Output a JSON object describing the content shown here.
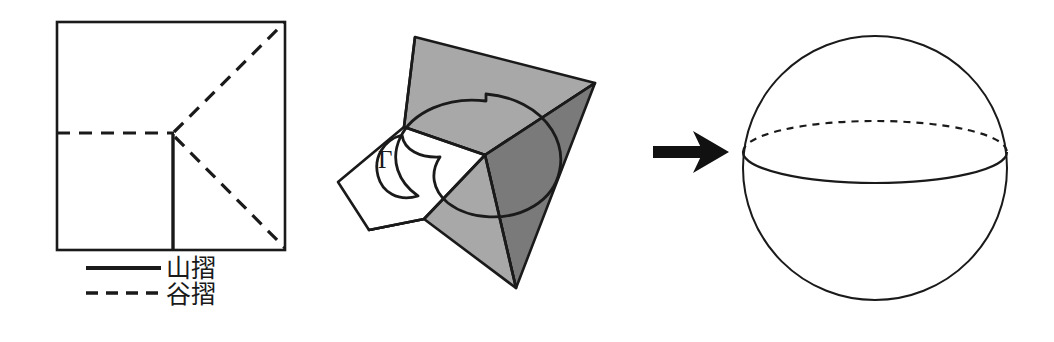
{
  "figure": {
    "colors": {
      "ink": "#1a1a1a",
      "paper_white": "#ffffff",
      "panel_light_gray": "#a8a8a8",
      "panel_dark_gray": "#7a7a7a",
      "arrow": "#111111"
    },
    "panels": [
      {
        "name": "crease-pattern",
        "index": 1
      },
      {
        "name": "folded-form",
        "index": 2
      },
      {
        "name": "sphere",
        "index": 3
      }
    ]
  },
  "crease_pattern": {
    "square": {
      "x": 57,
      "y": 22,
      "size": 228
    },
    "center_vertex": {
      "x": 173,
      "y": 134
    },
    "creases": [
      {
        "name": "mountain-vertical",
        "type": "mountain",
        "from": [
          173,
          134
        ],
        "to": [
          173,
          250
        ]
      },
      {
        "name": "valley-horizontal",
        "type": "valley",
        "from": [
          57,
          133
        ],
        "to": [
          173,
          133
        ]
      },
      {
        "name": "valley-diagonal-up",
        "type": "valley",
        "from": [
          173,
          133
        ],
        "to": [
          285,
          22
        ]
      },
      {
        "name": "valley-diagonal-down",
        "type": "valley",
        "from": [
          173,
          136
        ],
        "to": [
          285,
          248
        ]
      }
    ]
  },
  "legend": {
    "items": [
      {
        "name": "mountain-fold",
        "style": "solid",
        "label": "山摺"
      },
      {
        "name": "valley-fold",
        "style": "dashed",
        "label": "谷摺"
      }
    ]
  },
  "folded_form": {
    "curve_label": "Γ",
    "curve_label_position": {
      "x": 378,
      "y": 168
    },
    "vertices": {
      "top": [
        415,
        37
      ],
      "right": [
        595,
        83
      ],
      "bottom": [
        516,
        288
      ],
      "left": [
        338,
        182
      ],
      "center": [
        485,
        155
      ],
      "upper_left_fold": [
        404,
        127
      ],
      "lower_left_fold": [
        424,
        219
      ]
    },
    "faces": [
      {
        "name": "upper-light-panel",
        "shade": "light-gray"
      },
      {
        "name": "right-dark-panel",
        "shade": "dark-gray"
      },
      {
        "name": "lower-light-panel",
        "shade": "light-gray"
      },
      {
        "name": "front-white-panel",
        "shade": "white"
      }
    ]
  },
  "sphere": {
    "center": {
      "x": 875,
      "y": 168
    },
    "radius": 132,
    "equator": {
      "center_y": 152,
      "rx": 132,
      "ry": 31,
      "back_half_style": "dashed",
      "front_half_style": "solid"
    }
  },
  "arrow": {
    "name": "transform-arrow",
    "from": {
      "x": 653,
      "y": 152
    },
    "to": {
      "x": 729,
      "y": 152
    },
    "direction": "right"
  }
}
